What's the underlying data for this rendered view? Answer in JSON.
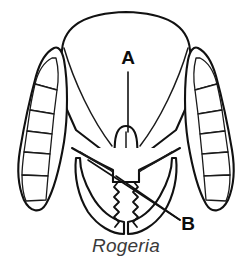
{
  "figure": {
    "caption": "Rogeria",
    "background_color": "#ffffff",
    "line_color": "#111111"
  },
  "labels": [
    {
      "id": "A",
      "text": "A",
      "refers_to": "clypeus",
      "x": 128,
      "y": 64,
      "leader": {
        "x1": 128,
        "y1": 72,
        "x2": 128,
        "y2": 132
      }
    },
    {
      "id": "B",
      "text": "B",
      "refers_to": "mandible",
      "x": 186,
      "y": 228,
      "leaders": [
        {
          "x1": 180,
          "y1": 220,
          "x2": 88,
          "y2": 160
        },
        {
          "x1": 180,
          "y1": 220,
          "x2": 116,
          "y2": 176
        }
      ]
    }
  ],
  "anatomy": {
    "head_label": "head-capsule",
    "clypeus_label": "clypeus",
    "left_mandible_label": "left-mandible",
    "right_mandible_label": "right-mandible",
    "left_antenna_label": "left-antenna",
    "right_antenna_label": "right-antenna",
    "left_eye_label": "left-eye",
    "right_eye_label": "right-eye",
    "antenna_segment_count": 8
  }
}
